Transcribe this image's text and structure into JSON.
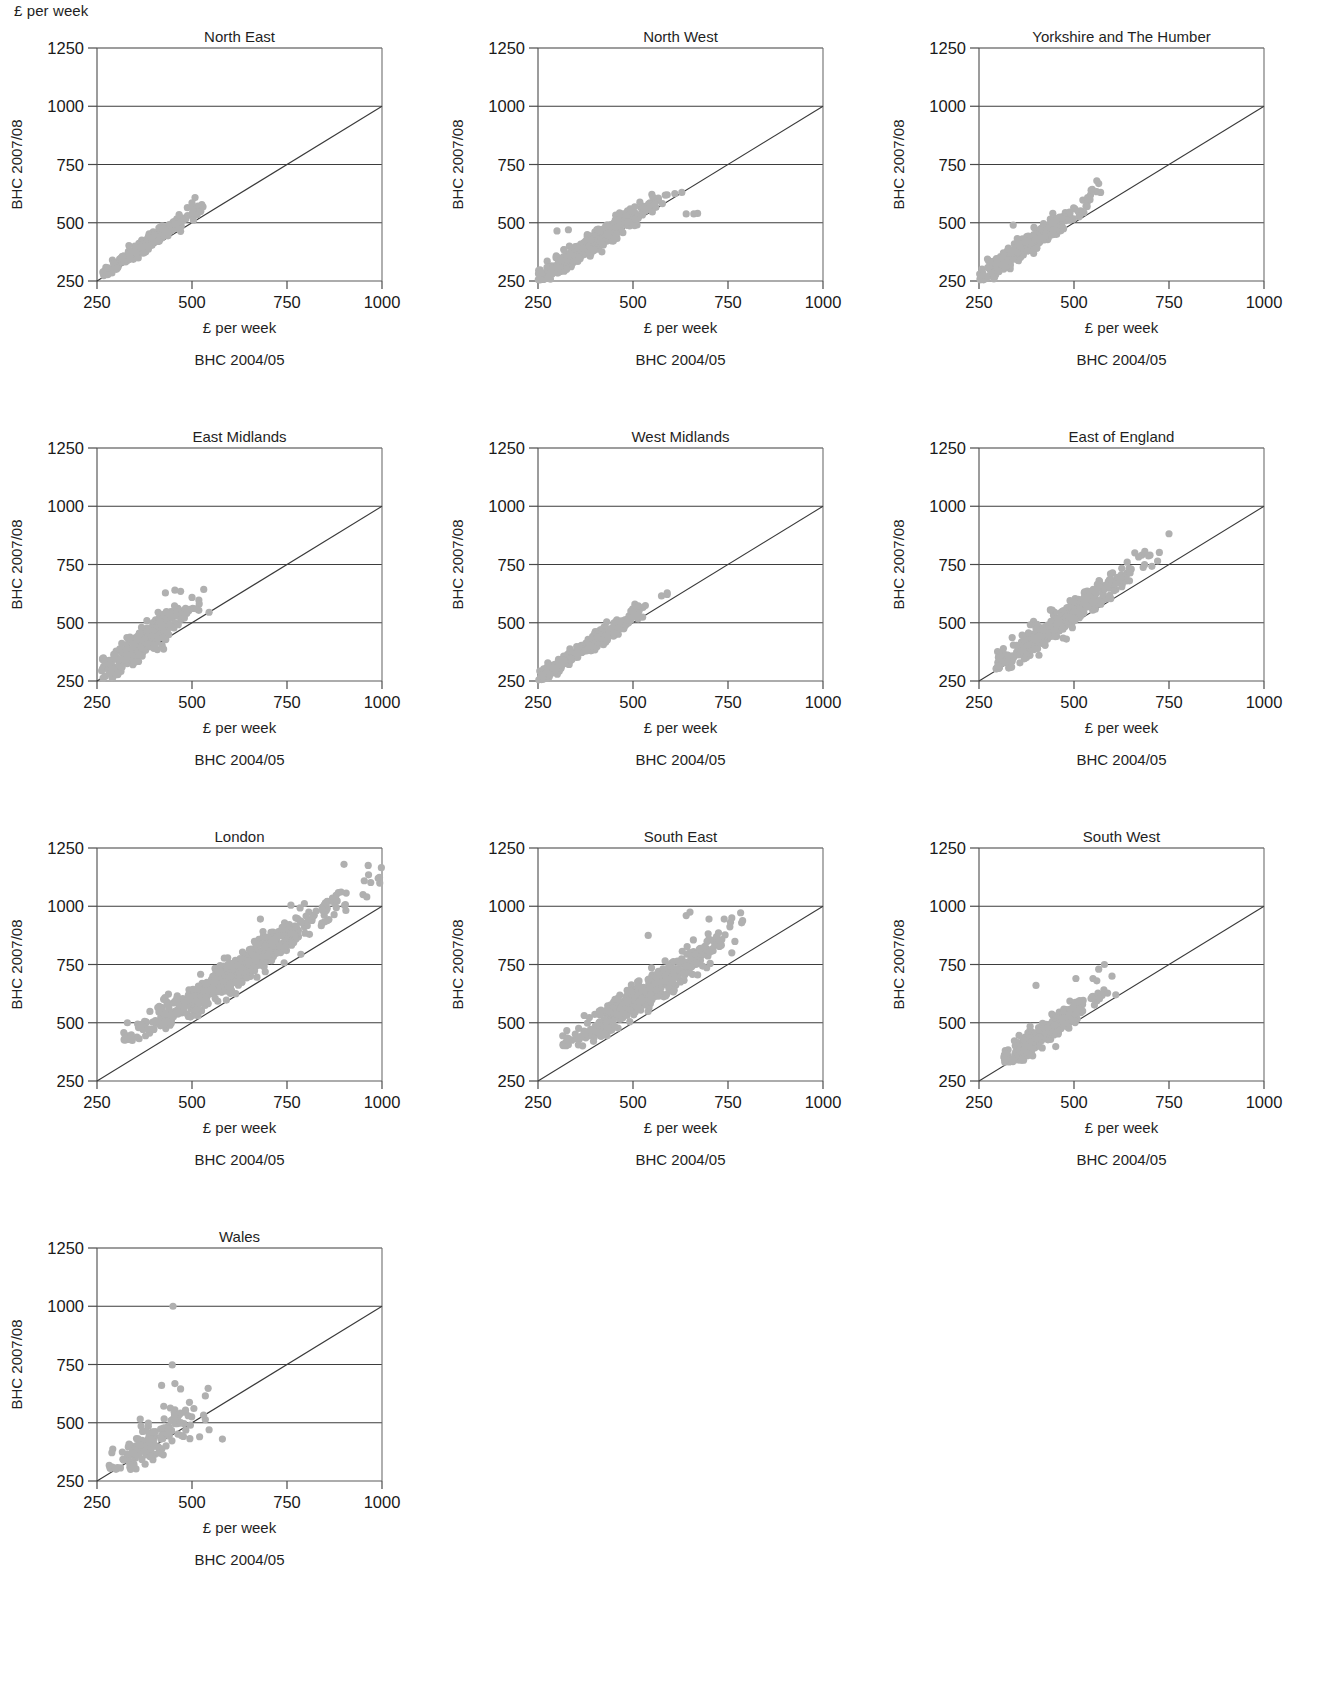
{
  "figure": {
    "unit_label_top": "£ per week",
    "y_axis_label": "BHC 2007/08",
    "x_axis_unit_label": "£ per week",
    "x_axis_caption": "BHC 2004/05",
    "point_color": "#b0b0b0",
    "grid_color": "#3d3d3d",
    "line_color": "#3a3a3a"
  },
  "chart_data": {
    "type": "scatter",
    "title": "",
    "xlabel": "£ per week",
    "ylabel": "£ per week",
    "xlim": [
      250,
      1000
    ],
    "ylim": [
      250,
      1250
    ],
    "xticks": [
      250,
      500,
      750,
      1000
    ],
    "yticks": [
      250,
      500,
      750,
      1000,
      1250
    ],
    "xticklabels": [
      "250",
      "500",
      "750",
      "1000"
    ],
    "yticklabels": [
      "250",
      "500",
      "750",
      "1000",
      "1250"
    ],
    "grid": "horizontal",
    "legend": "none",
    "reference_line": {
      "description": "y = x identity line",
      "from": [
        250,
        250
      ],
      "to": [
        1000,
        1000
      ]
    },
    "panels": [
      {
        "title": "North East",
        "row": 0,
        "col": 0,
        "n_points": 230,
        "x_range": [
          265,
          530
        ],
        "y_range": [
          268,
          610
        ],
        "cluster": {
          "x_mean": 390,
          "x_sd": 62,
          "slope": 1.12,
          "intercept": -18,
          "resid_sd": 16
        },
        "outliers": [
          [
            508,
            608
          ],
          [
            500,
            585
          ],
          [
            470,
            463
          ]
        ]
      },
      {
        "title": "North West",
        "row": 0,
        "col": 1,
        "n_points": 420,
        "x_range": [
          248,
          670
        ],
        "y_range": [
          252,
          640
        ],
        "cluster": {
          "x_mean": 400,
          "x_sd": 78,
          "slope": 1.06,
          "intercept": -2,
          "resid_sd": 22
        },
        "outliers": [
          [
            640,
            538
          ],
          [
            660,
            538
          ],
          [
            670,
            540
          ],
          [
            300,
            465
          ],
          [
            330,
            470
          ],
          [
            610,
            625
          ],
          [
            590,
            620
          ]
        ]
      },
      {
        "title": "Yorkshire and The Humber",
        "row": 0,
        "col": 2,
        "n_points": 330,
        "x_range": [
          248,
          580
        ],
        "y_range": [
          252,
          690
        ],
        "cluster": {
          "x_mean": 380,
          "x_sd": 72,
          "slope": 1.13,
          "intercept": -22,
          "resid_sd": 22
        },
        "outliers": [
          [
            340,
            490
          ],
          [
            560,
            680
          ],
          [
            565,
            668
          ],
          [
            545,
            640
          ],
          [
            570,
            630
          ]
        ]
      },
      {
        "title": "East Midlands",
        "row": 1,
        "col": 0,
        "n_points": 300,
        "x_range": [
          262,
          560
        ],
        "y_range": [
          262,
          645
        ],
        "cluster": {
          "x_mean": 380,
          "x_sd": 62,
          "slope": 1.22,
          "intercept": -38,
          "resid_sd": 32
        },
        "outliers": [
          [
            455,
            640
          ],
          [
            470,
            635
          ],
          [
            430,
            628
          ],
          [
            545,
            545
          ],
          [
            510,
            560
          ],
          [
            395,
            445
          ],
          [
            480,
            520
          ]
        ]
      },
      {
        "title": "West Midlands",
        "row": 1,
        "col": 1,
        "n_points": 300,
        "x_range": [
          252,
          600
        ],
        "y_range": [
          255,
          630
        ],
        "cluster": {
          "x_mean": 390,
          "x_sd": 70,
          "slope": 1.07,
          "intercept": -6,
          "resid_sd": 16
        },
        "outliers": [
          [
            590,
            628
          ],
          [
            575,
            615
          ],
          [
            262,
            272
          ]
        ]
      },
      {
        "title": "East of England",
        "row": 1,
        "col": 2,
        "n_points": 380,
        "x_range": [
          295,
          760
        ],
        "y_range": [
          300,
          890
        ],
        "cluster": {
          "x_mean": 470,
          "x_sd": 92,
          "slope": 1.14,
          "intercept": -22,
          "resid_sd": 30
        },
        "outliers": [
          [
            750,
            882
          ],
          [
            660,
            800
          ],
          [
            700,
            790
          ],
          [
            720,
            765
          ],
          [
            705,
            742
          ],
          [
            640,
            760
          ],
          [
            480,
            430
          ],
          [
            300,
            315
          ]
        ]
      },
      {
        "title": "London",
        "row": 2,
        "col": 0,
        "n_points": 560,
        "x_range": [
          320,
          1000
        ],
        "y_range": [
          420,
          1180
        ],
        "cluster": {
          "x_mean": 610,
          "x_sd": 130,
          "slope": 1.08,
          "intercept": 58,
          "resid_sd": 36
        },
        "outliers": [
          [
            900,
            1180
          ],
          [
            990,
            1120
          ],
          [
            950,
            1050
          ],
          [
            960,
            1040
          ],
          [
            330,
            500
          ],
          [
            680,
            945
          ],
          [
            600,
            755
          ]
        ]
      },
      {
        "title": "South East",
        "row": 2,
        "col": 1,
        "n_points": 470,
        "x_range": [
          315,
          790
        ],
        "y_range": [
          400,
          975
        ],
        "cluster": {
          "x_mean": 530,
          "x_sd": 98,
          "slope": 1.12,
          "intercept": 32,
          "resid_sd": 34
        },
        "outliers": [
          [
            650,
            975
          ],
          [
            640,
            960
          ],
          [
            700,
            945
          ],
          [
            740,
            945
          ],
          [
            760,
            950
          ],
          [
            720,
            870
          ],
          [
            540,
            875
          ],
          [
            760,
            800
          ]
        ]
      },
      {
        "title": "South West",
        "row": 2,
        "col": 2,
        "n_points": 300,
        "x_range": [
          315,
          620
        ],
        "y_range": [
          330,
          755
        ],
        "cluster": {
          "x_mean": 420,
          "x_sd": 62,
          "slope": 1.11,
          "intercept": -12,
          "resid_sd": 26
        },
        "outliers": [
          [
            580,
            750
          ],
          [
            565,
            730
          ],
          [
            600,
            700
          ],
          [
            550,
            690
          ],
          [
            560,
            680
          ],
          [
            400,
            660
          ],
          [
            505,
            690
          ],
          [
            610,
            620
          ]
        ]
      },
      {
        "title": "Wales",
        "row": 3,
        "col": 0,
        "n_points": 150,
        "x_range": [
          280,
          600
        ],
        "y_range": [
          300,
          1000
        ],
        "cluster": {
          "x_mean": 390,
          "x_sd": 60,
          "slope": 1.1,
          "intercept": -10,
          "resid_sd": 45
        },
        "outliers": [
          [
            450,
            1000
          ],
          [
            448,
            748
          ],
          [
            455,
            668
          ],
          [
            420,
            660
          ],
          [
            470,
            645
          ],
          [
            580,
            430
          ],
          [
            520,
            440
          ],
          [
            490,
            530
          ],
          [
            545,
            470
          ]
        ]
      }
    ]
  }
}
